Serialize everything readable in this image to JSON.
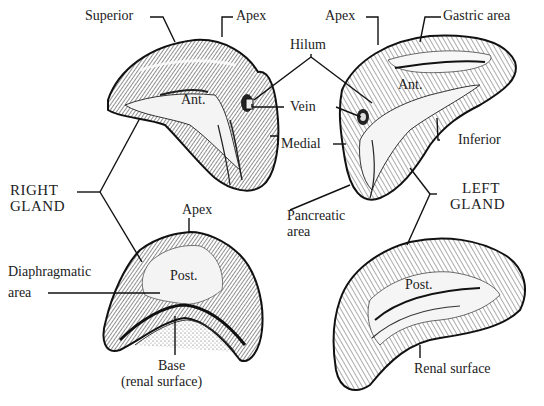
{
  "figure": {
    "right_gland": {
      "name_line1": "RIGHT",
      "name_line2": "GLAND",
      "anterior_view": {
        "surface_label": "Ant.",
        "labels": {
          "superior": "Superior",
          "apex": "Apex",
          "vein": "Vein",
          "medial": "Medial"
        }
      },
      "posterior_view": {
        "surface_label": "Post.",
        "labels": {
          "apex": "Apex",
          "diaphragmatic_line1": "Diaphragmatic",
          "diaphragmatic_line2": "area",
          "base_line1": "Base",
          "base_line2": "(renal surface)"
        }
      }
    },
    "left_gland": {
      "name_line1": "LEFT",
      "name_line2": "GLAND",
      "anterior_view": {
        "surface_label": "Ant.",
        "labels": {
          "apex": "Apex",
          "gastric": "Gastric area",
          "inferior": "Inferior",
          "pancreatic_line1": "Pancreatic",
          "pancreatic_line2": "area"
        }
      },
      "posterior_view": {
        "surface_label": "Post.",
        "labels": {
          "renal": "Renal surface"
        }
      }
    },
    "shared_labels": {
      "hilum": "Hilum"
    },
    "colors": {
      "ink": "#1a1a1a",
      "paper": "#ffffff",
      "shade": "#6b6b6b",
      "light": "#d9d9d9"
    }
  }
}
